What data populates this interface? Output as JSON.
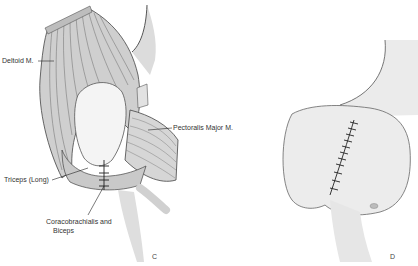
{
  "figure": {
    "panels": [
      {
        "id": "C",
        "letter": "C",
        "labels": {
          "deltoid": "Deltoid M.",
          "pectoralis": "Pectoralis Major M.",
          "triceps": "Triceps (Long)",
          "coraco_line1": "Coracobrachialis and",
          "coraco_line2": "Biceps"
        }
      },
      {
        "id": "D",
        "letter": "D"
      }
    ],
    "colors": {
      "background": "#ffffff",
      "ink": "#2a2a2a",
      "shade": "#cfcfcf",
      "light": "#ececec"
    }
  }
}
